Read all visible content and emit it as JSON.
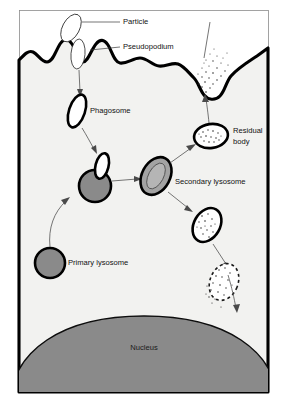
{
  "diagram": {
    "background_color": "#ffffff",
    "cytoplasm_color": "#f2f2f0",
    "nucleus_color": "#8a8a8a",
    "lysosome_color": "#8a8a8a",
    "secondary_lysosome_color": "#a3a3a3",
    "membrane_color": "#000000",
    "label_color": "#111111",
    "leader_color": "#3a3a3a",
    "labels": {
      "particle": "Particle",
      "pseudopodium": "Pseudopodium",
      "phagosome": "Phagosome",
      "primary_lysosome": "Primary lysosome",
      "secondary_lysosome": "Secondary lysosome",
      "residual_body_line1": "Residual",
      "residual_body_line2": "body",
      "nucleus": "Nucleus"
    },
    "structures": [
      {
        "name": "particle",
        "type": "ellipse-outline",
        "fill": "#ffffff"
      },
      {
        "name": "pseudopodium",
        "type": "membrane-projection",
        "fill": "#f2f2f0"
      },
      {
        "name": "phagosome",
        "type": "ellipse-outline",
        "fill": "#ffffff"
      },
      {
        "name": "primary-lysosome",
        "type": "filled-circle",
        "fill": "#8a8a8a"
      },
      {
        "name": "fusion-vesicle",
        "type": "circle-with-vesicle",
        "fill": "#8a8a8a"
      },
      {
        "name": "secondary-lysosome",
        "type": "ellipse-double",
        "fill": "#a3a3a3"
      },
      {
        "name": "residual-body",
        "type": "ellipse-stippled",
        "fill": "#ffffff"
      },
      {
        "name": "digesting-vesicle",
        "type": "ellipse-stippled",
        "fill": "#ffffff"
      },
      {
        "name": "exocytosis-vesicle",
        "type": "dashed-ellipse-stippled",
        "fill": "#ffffff"
      },
      {
        "name": "nucleus",
        "type": "dome",
        "fill": "#8a8a8a"
      }
    ]
  }
}
